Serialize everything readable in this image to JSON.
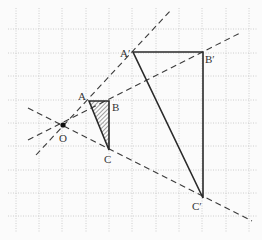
{
  "diagram": {
    "type": "homothety",
    "grid": {
      "x_lines": [
        16,
        39,
        62,
        86,
        109,
        132,
        156,
        179,
        202,
        226,
        249
      ],
      "y_lines": [
        29,
        53,
        76,
        100,
        123,
        146,
        170,
        193,
        216
      ],
      "color": "#bdbdbd"
    },
    "center": {
      "label": "O",
      "x": 63,
      "y": 125
    },
    "small_triangle": {
      "A": {
        "label": "A",
        "x": 89,
        "y": 101
      },
      "B": {
        "label": "B",
        "x": 109,
        "y": 101
      },
      "C": {
        "label": "C",
        "x": 109,
        "y": 150
      },
      "hatched": true
    },
    "large_triangle": {
      "A": {
        "label": "A′",
        "x": 133,
        "y": 52
      },
      "B": {
        "label": "B′",
        "x": 203,
        "y": 52
      },
      "C": {
        "label": "C′",
        "x": 203,
        "y": 198
      }
    },
    "colors": {
      "line": "#2a2a2a",
      "dashed": "#3a3a3a",
      "hatch": "#444444"
    }
  }
}
